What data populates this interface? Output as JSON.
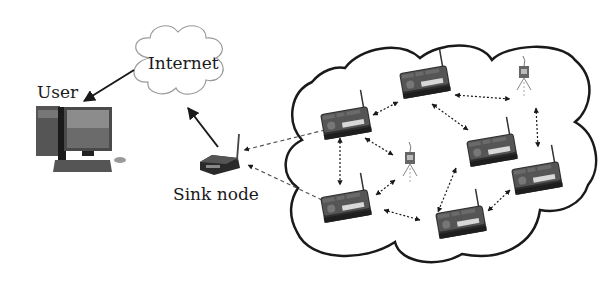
{
  "diagram": {
    "type": "wireless sensor network architecture",
    "labels": {
      "internet": "Internet",
      "user": "User",
      "sink": "Sink node"
    },
    "colors": {
      "line": "#1a1a1a",
      "cloud_internet": "#9a9a9a",
      "cloud_network": "#1a1a1a",
      "board": "#3a3a3a",
      "board_strip": "#d8d8d8"
    },
    "nodes": [
      {
        "id": "user",
        "kind": "computer",
        "label": "User"
      },
      {
        "id": "internet",
        "kind": "cloud",
        "label": "Internet"
      },
      {
        "id": "sink",
        "kind": "gateway",
        "label": "Sink node"
      },
      {
        "id": "s1",
        "kind": "sensor-board"
      },
      {
        "id": "s2",
        "kind": "sensor-board"
      },
      {
        "id": "s3",
        "kind": "sensor-board"
      },
      {
        "id": "s4",
        "kind": "sensor-board"
      },
      {
        "id": "s5",
        "kind": "sensor-board"
      },
      {
        "id": "s6",
        "kind": "sensor-board"
      },
      {
        "id": "m1",
        "kind": "sensor-mote"
      },
      {
        "id": "m2",
        "kind": "sensor-mote"
      }
    ],
    "edges": [
      {
        "from": "internet",
        "to": "user",
        "style": "solid",
        "directed": true
      },
      {
        "from": "sink",
        "to": "internet",
        "style": "solid",
        "directed": true
      },
      {
        "from": "s1",
        "to": "sink",
        "style": "dashed",
        "directed": true
      },
      {
        "from": "s5",
        "to": "sink",
        "style": "dashed",
        "directed": true
      },
      {
        "from": "s1",
        "to": "s2",
        "style": "dotted",
        "directed": "both"
      },
      {
        "from": "s1",
        "to": "m1",
        "style": "dotted",
        "directed": "both"
      },
      {
        "from": "s1",
        "to": "s5",
        "style": "dotted",
        "directed": "both"
      },
      {
        "from": "s2",
        "to": "m2",
        "style": "dotted",
        "directed": "both"
      },
      {
        "from": "s2",
        "to": "s3",
        "style": "dotted",
        "directed": "both"
      },
      {
        "from": "m2",
        "to": "s4",
        "style": "dotted",
        "directed": "both"
      },
      {
        "from": "m1",
        "to": "s5",
        "style": "dotted",
        "directed": "both"
      },
      {
        "from": "s5",
        "to": "s6",
        "style": "dotted",
        "directed": "both"
      },
      {
        "from": "s3",
        "to": "s6",
        "style": "dotted",
        "directed": "both"
      },
      {
        "from": "s4",
        "to": "s6",
        "style": "dotted",
        "directed": "both"
      }
    ]
  }
}
